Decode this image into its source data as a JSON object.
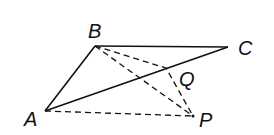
{
  "diagram": {
    "type": "geometry",
    "points": {
      "A": {
        "label": "A",
        "x": 45,
        "y": 111,
        "label_x": 24,
        "label_y": 126
      },
      "B": {
        "label": "B",
        "x": 95,
        "y": 46,
        "label_x": 88,
        "label_y": 38
      },
      "C": {
        "label": "C",
        "x": 228,
        "y": 47,
        "label_x": 238,
        "label_y": 55
      },
      "P": {
        "label": "P",
        "x": 193,
        "y": 116,
        "label_x": 199,
        "label_y": 127
      },
      "Q": {
        "label": "Q",
        "x": 166,
        "y": 68,
        "label_x": 179,
        "label_y": 86
      }
    },
    "segments": [
      {
        "from": "A",
        "to": "B",
        "style": "solid"
      },
      {
        "from": "B",
        "to": "C",
        "style": "solid"
      },
      {
        "from": "A",
        "to": "C",
        "style": "solid"
      },
      {
        "from": "B",
        "to": "P",
        "style": "dashed",
        "via": "Q"
      },
      {
        "from": "B",
        "to": "P",
        "style": "dashed"
      },
      {
        "from": "A",
        "to": "P",
        "style": "dashed"
      }
    ],
    "colors": {
      "stroke": "#111111",
      "background": "#ffffff"
    }
  }
}
